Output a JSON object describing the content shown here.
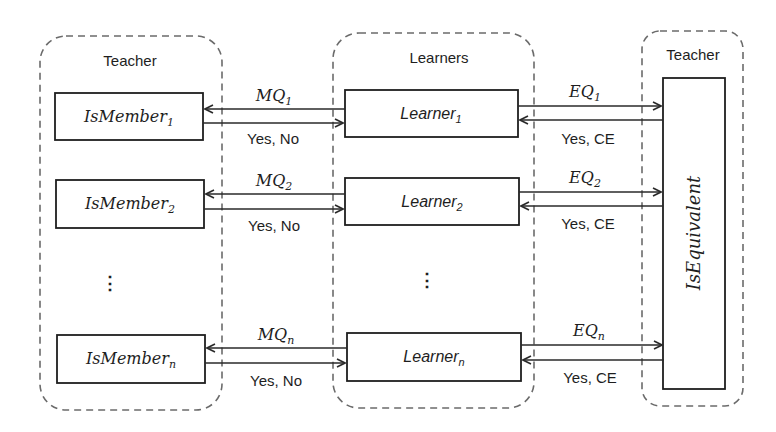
{
  "groups": {
    "left_teacher": {
      "title": "Teacher"
    },
    "learners": {
      "title": "Learners"
    },
    "right_teacher": {
      "title": "Teacher"
    }
  },
  "members": [
    {
      "name": "IsMember",
      "sub": "1"
    },
    {
      "name": "IsMember",
      "sub": "2"
    },
    {
      "name": "IsMember",
      "sub": "n"
    }
  ],
  "learners": [
    {
      "name": "Learner",
      "sub": "1"
    },
    {
      "name": "Learner",
      "sub": "2"
    },
    {
      "name": "Learner",
      "sub": "n"
    }
  ],
  "equivalence": {
    "name": "IsEquivalent"
  },
  "membership_queries": [
    {
      "name": "MQ",
      "sub": "1",
      "reply": "Yes, No"
    },
    {
      "name": "MQ",
      "sub": "2",
      "reply": "Yes, No"
    },
    {
      "name": "MQ",
      "sub": "n",
      "reply": "Yes, No"
    }
  ],
  "equivalence_queries": [
    {
      "name": "EQ",
      "sub": "1",
      "reply": "Yes, CE"
    },
    {
      "name": "EQ",
      "sub": "2",
      "reply": "Yes, CE"
    },
    {
      "name": "EQ",
      "sub": "n",
      "reply": "Yes, CE"
    }
  ],
  "ellipsis": "⋮"
}
